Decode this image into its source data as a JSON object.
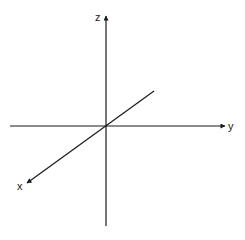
{
  "diagram": {
    "type": "3d-coordinate-axes",
    "origin": [
      106,
      126
    ],
    "colors": {
      "axis": "#1a1a1a",
      "background": "#ffffff"
    },
    "axes": [
      {
        "name": "z",
        "label": "z",
        "direction": "up"
      },
      {
        "name": "y",
        "label": "y",
        "direction": "right"
      },
      {
        "name": "x",
        "label": "x",
        "direction": "down-left (toward viewer)"
      }
    ]
  }
}
